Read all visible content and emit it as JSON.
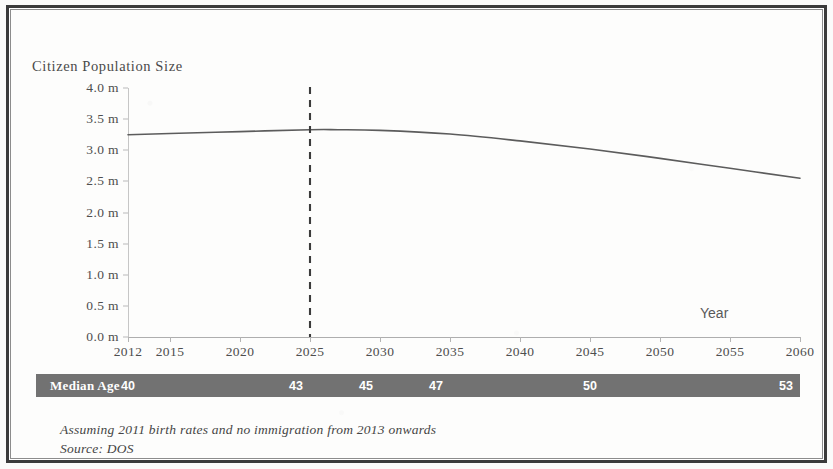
{
  "figure": {
    "frame_color": "#3b3b3b",
    "background": "#ffffff"
  },
  "chart_data": {
    "type": "line",
    "title": "",
    "ylabel": "Citizen Population Size",
    "xlabel": "Year",
    "x": [
      2012,
      2015,
      2020,
      2025,
      2030,
      2035,
      2040,
      2045,
      2050,
      2055,
      2060
    ],
    "xlim": [
      2012,
      2060
    ],
    "ylim": [
      0.0,
      4.0
    ],
    "y_tick_labels": [
      "0.0 m",
      "0.5 m",
      "1.0 m",
      "1.5 m",
      "2.0 m",
      "2.5 m",
      "3.0 m",
      "3.5 m",
      "4.0 m"
    ],
    "y_tick_values": [
      0.0,
      0.5,
      1.0,
      1.5,
      2.0,
      2.5,
      3.0,
      3.5,
      4.0
    ],
    "x_tick_labels": [
      "2012",
      "2015",
      "2020",
      "2025",
      "2030",
      "2035",
      "2040",
      "2045",
      "2050",
      "2055",
      "2060"
    ],
    "grid": false,
    "legend": "none",
    "line_color": "#5c5c5c",
    "series": [
      {
        "name": "Citizen Population Size",
        "units": "millions",
        "points": [
          {
            "year": 2012,
            "value": 3.25
          },
          {
            "year": 2015,
            "value": 3.27
          },
          {
            "year": 2020,
            "value": 3.3
          },
          {
            "year": 2025,
            "value": 3.33
          },
          {
            "year": 2027,
            "value": 3.33
          },
          {
            "year": 2030,
            "value": 3.32
          },
          {
            "year": 2035,
            "value": 3.26
          },
          {
            "year": 2040,
            "value": 3.15
          },
          {
            "year": 2045,
            "value": 3.02
          },
          {
            "year": 2050,
            "value": 2.87
          },
          {
            "year": 2055,
            "value": 2.71
          },
          {
            "year": 2060,
            "value": 2.55
          }
        ]
      }
    ],
    "annotations": [
      {
        "type": "vertical-dashed-line",
        "name": "reference-line-2025",
        "x": 2025,
        "color": "#3b3b3b",
        "label": ""
      }
    ]
  },
  "median_age_band": {
    "label": "Median Age",
    "background": "#727272",
    "text_color": "#ffffff",
    "values": [
      {
        "age": "40",
        "year": 2012
      },
      {
        "age": "43",
        "year": 2024
      },
      {
        "age": "45",
        "year": 2029
      },
      {
        "age": "47",
        "year": 2034
      },
      {
        "age": "50",
        "year": 2045
      },
      {
        "age": "53",
        "year": 2059
      }
    ]
  },
  "footnotes": {
    "line1": "Assuming 2011 birth rates and no immigration from 2013 onwards",
    "line2": "Source: DOS"
  }
}
